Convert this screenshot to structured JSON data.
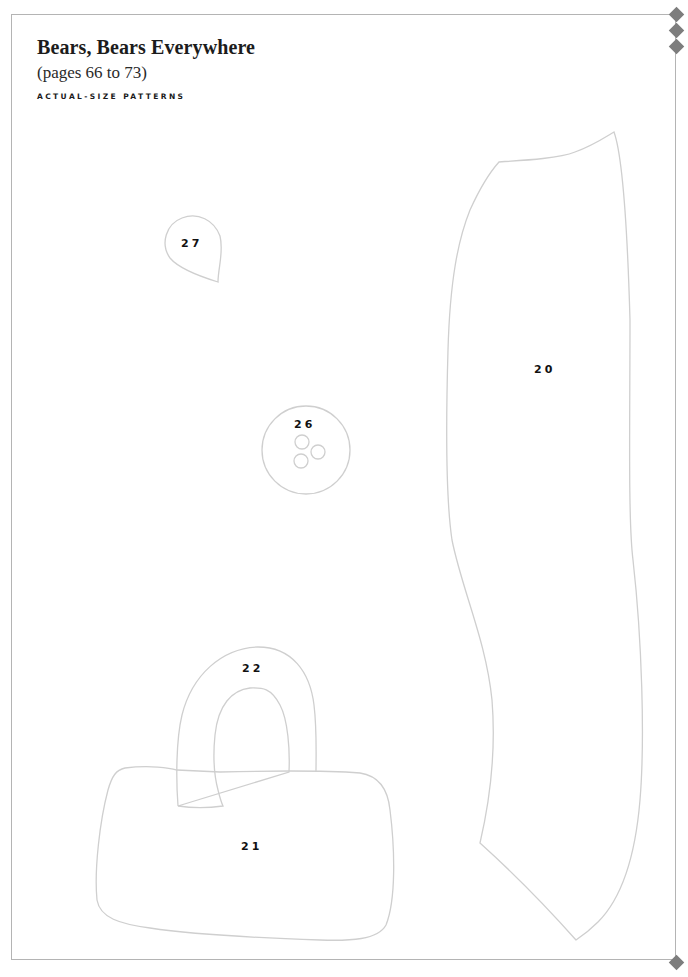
{
  "header": {
    "title": "Bears, Bears Everywhere",
    "subtitle": "(pages 66 to 73)",
    "section_label": "ACTUAL-SIZE PATTERNS"
  },
  "pieces": [
    {
      "id": "piece-20",
      "label": "20",
      "shape": "tall-leg-panel"
    },
    {
      "id": "piece-21",
      "label": "21",
      "shape": "bag-body"
    },
    {
      "id": "piece-22",
      "label": "22",
      "shape": "bag-handle-arch"
    },
    {
      "id": "piece-26",
      "label": "26",
      "shape": "circle-with-three-holes"
    },
    {
      "id": "piece-27",
      "label": "27",
      "shape": "teardrop"
    }
  ],
  "colors": {
    "frame": "#b4b4b4",
    "outline": "#cfcfcf",
    "diamond": "#7d7d7d",
    "text": "#1c1c1c"
  }
}
